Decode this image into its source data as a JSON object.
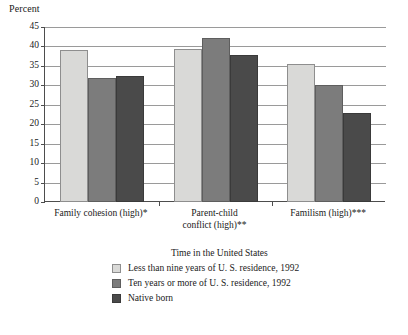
{
  "chart_data": {
    "type": "bar",
    "title": "",
    "xlabel": "",
    "ylabel": "Percent",
    "ylim": [
      0,
      45
    ],
    "ytick_labels": [
      "45",
      "40",
      "35",
      "30",
      "25",
      "20",
      "15",
      "10",
      "5",
      "0"
    ],
    "ytick_values": [
      45,
      40,
      35,
      30,
      25,
      20,
      15,
      10,
      5,
      0
    ],
    "grid": true,
    "legend_position": "bottom",
    "legend_title": "Time in the United States",
    "categories": [
      "Family cohesion (high)*",
      "Parent-child\nconflict (high)**",
      "Familism (high)***"
    ],
    "series": [
      {
        "name": "Less than nine years of U. S. residence, 1992",
        "color": "#d9d9d7",
        "values": [
          39.0,
          39.3,
          35.5
        ]
      },
      {
        "name": "Ten years or more of U. S. residence, 1992",
        "color": "#7c7c7c",
        "values": [
          32.0,
          42.2,
          30.0
        ]
      },
      {
        "name": "Native born",
        "color": "#4a4a4a",
        "values": [
          32.3,
          37.8,
          23.0
        ]
      }
    ]
  }
}
